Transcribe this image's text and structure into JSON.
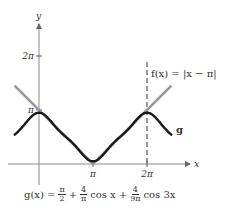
{
  "chart_data": {
    "type": "line",
    "title": "",
    "xlabel": "x",
    "ylabel": "y",
    "xlim_pi": [
      -0.45,
      2.55
    ],
    "ylim_pi": [
      0,
      2.1
    ],
    "x_ticks": [
      {
        "value_pi": 1,
        "label": "π"
      },
      {
        "value_pi": 2,
        "label": "2π"
      }
    ],
    "y_ticks": [
      {
        "value_pi": 1,
        "label": "π"
      },
      {
        "value_pi": 2,
        "label": "2π"
      }
    ],
    "series": [
      {
        "name": "f",
        "label": "f(x) = |x − π|",
        "expression": "abs(x - pi)",
        "color": "#9a9a9a",
        "domain_pi": [
          -0.45,
          2.45
        ],
        "style": "solid"
      },
      {
        "name": "g",
        "label": "g",
        "expression": "pi/2 + 4/pi*cos(x) + 4/(9*pi)*cos(3x)",
        "color": "#1a1a1a",
        "domain_pi": [
          -0.45,
          2.45
        ],
        "style": "solid"
      }
    ],
    "annotations": [
      {
        "type": "vertical-dashed-line",
        "x_pi": 2
      }
    ],
    "f_label": "f(x) = |x − π|",
    "g_label": "g",
    "formula": {
      "lhs": "g(x) =",
      "term1_num": "π",
      "term1_den": "2",
      "plus1": "+",
      "term2_num": "4",
      "term2_den": "π",
      "term2_fn": "cos x",
      "plus2": "+",
      "term3_num": "4",
      "term3_den": "9π",
      "term3_fn": "cos 3x"
    }
  }
}
